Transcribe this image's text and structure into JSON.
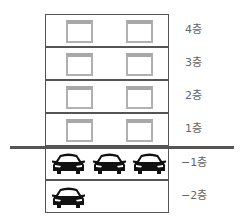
{
  "diagram": {
    "type": "building-floor-section",
    "ground_line_color": "#555555",
    "above_ground_floors": [
      {
        "label": "4층",
        "windows": 2
      },
      {
        "label": "3층",
        "windows": 2
      },
      {
        "label": "2층",
        "windows": 2
      },
      {
        "label": "1층",
        "windows": 2
      }
    ],
    "below_ground_floors": [
      {
        "label": "−1층",
        "cars": 3
      },
      {
        "label": "−2층",
        "cars": 1
      }
    ],
    "icons": {
      "window": "window-icon",
      "car": "car-icon"
    }
  }
}
